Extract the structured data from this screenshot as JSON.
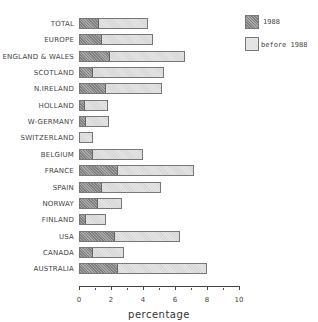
{
  "chart_data": {
    "type": "bar",
    "orientation": "horizontal",
    "stacked": true,
    "title": "",
    "xlabel": "percentage",
    "ylabel": "",
    "xlim": [
      0,
      10
    ],
    "xticks": [
      "0",
      "2",
      "4",
      "6",
      "8",
      "10"
    ],
    "grid": false,
    "legend_position": "top-right",
    "categories": [
      "TOTAL",
      "EUROPE",
      "ENGLAND & WALES",
      "SCOTLAND",
      "N.IRELAND",
      "HOLLAND",
      "W-GERMANY",
      "SWITZERLAND",
      "BELGIUM",
      "FRANCE",
      "SPAIN",
      "NORWAY",
      "FINLAND",
      "USA",
      "CANADA",
      "AUSTRALIA"
    ],
    "series": [
      {
        "name": "1988",
        "color": "#a9a9a9",
        "values": [
          1.2,
          1.4,
          1.9,
          0.8,
          1.6,
          0.3,
          0.4,
          0.0,
          0.8,
          2.4,
          1.4,
          1.1,
          0.4,
          2.2,
          0.8,
          2.4
        ]
      },
      {
        "name": "before 1988",
        "color": "#e4e4e4",
        "values": [
          3.1,
          3.2,
          4.7,
          4.5,
          3.6,
          1.5,
          1.5,
          0.9,
          3.2,
          4.8,
          3.7,
          1.6,
          1.3,
          4.1,
          2.0,
          5.6
        ]
      }
    ],
    "totals": [
      4.3,
      4.6,
      6.6,
      5.3,
      5.2,
      1.8,
      1.9,
      0.9,
      4.0,
      7.2,
      5.1,
      2.7,
      1.7,
      6.3,
      2.8,
      8.0
    ]
  },
  "legend": {
    "items": [
      {
        "label": "1988"
      },
      {
        "label": "before 1988"
      }
    ]
  }
}
